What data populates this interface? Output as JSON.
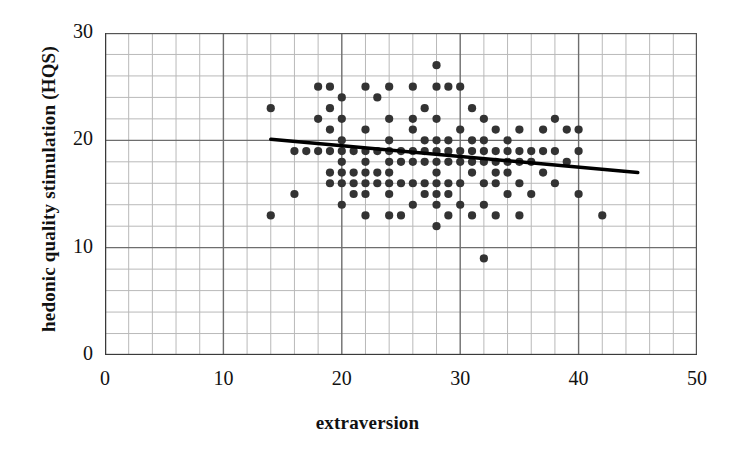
{
  "chart_data": {
    "type": "scatter",
    "title": "",
    "xlabel": "extraversion",
    "ylabel": "hedonic quality stimulation (HQS)",
    "xlim": [
      0,
      50
    ],
    "ylim": [
      0,
      30
    ],
    "xticks": [
      "0",
      "10",
      "20",
      "30",
      "40",
      "50"
    ],
    "xtick_values": [
      0,
      10,
      20,
      30,
      40,
      50
    ],
    "yticks": [
      "0",
      "10",
      "20",
      "30"
    ],
    "ytick_values": [
      0,
      10,
      20,
      30
    ],
    "grid": "major and minor gridlines, minor every 2 units on both axes",
    "legend": "none",
    "marker_color": "#333333",
    "line_color": "#000000",
    "trendline": {
      "label": "linear regression fit",
      "x": [
        14,
        45
      ],
      "y": [
        20.1,
        17.0
      ]
    },
    "points": [
      [
        14,
        23
      ],
      [
        14,
        13
      ],
      [
        16,
        19
      ],
      [
        16,
        15
      ],
      [
        17,
        19
      ],
      [
        18,
        19
      ],
      [
        18,
        25
      ],
      [
        18,
        22
      ],
      [
        19,
        19
      ],
      [
        19,
        23
      ],
      [
        19,
        25
      ],
      [
        19,
        21
      ],
      [
        19,
        17
      ],
      [
        19,
        16
      ],
      [
        20,
        19
      ],
      [
        20,
        24
      ],
      [
        20,
        22
      ],
      [
        20,
        20
      ],
      [
        20,
        18
      ],
      [
        20,
        17
      ],
      [
        20,
        16
      ],
      [
        20,
        14
      ],
      [
        21,
        19
      ],
      [
        21,
        17
      ],
      [
        21,
        16
      ],
      [
        21,
        15
      ],
      [
        22,
        19
      ],
      [
        22,
        25
      ],
      [
        22,
        21
      ],
      [
        22,
        18
      ],
      [
        22,
        17
      ],
      [
        22,
        16
      ],
      [
        22,
        15
      ],
      [
        22,
        13
      ],
      [
        23,
        19
      ],
      [
        23,
        24
      ],
      [
        23,
        17
      ],
      [
        23,
        16
      ],
      [
        24,
        25
      ],
      [
        24,
        22
      ],
      [
        24,
        20
      ],
      [
        24,
        19
      ],
      [
        24,
        18
      ],
      [
        24,
        17
      ],
      [
        24,
        16
      ],
      [
        24,
        15
      ],
      [
        24,
        13
      ],
      [
        25,
        19
      ],
      [
        25,
        18
      ],
      [
        25,
        16
      ],
      [
        25,
        13
      ],
      [
        26,
        25
      ],
      [
        26,
        22
      ],
      [
        26,
        21
      ],
      [
        26,
        19
      ],
      [
        26,
        18
      ],
      [
        26,
        16
      ],
      [
        26,
        14
      ],
      [
        27,
        23
      ],
      [
        27,
        20
      ],
      [
        27,
        19
      ],
      [
        27,
        18
      ],
      [
        27,
        16
      ],
      [
        27,
        15
      ],
      [
        28,
        27
      ],
      [
        28,
        25
      ],
      [
        28,
        22
      ],
      [
        28,
        20
      ],
      [
        28,
        19
      ],
      [
        28,
        18
      ],
      [
        28,
        17
      ],
      [
        28,
        16
      ],
      [
        28,
        15
      ],
      [
        28,
        14
      ],
      [
        28,
        12
      ],
      [
        29,
        25
      ],
      [
        29,
        20
      ],
      [
        29,
        19
      ],
      [
        29,
        18
      ],
      [
        29,
        16
      ],
      [
        29,
        15
      ],
      [
        29,
        13
      ],
      [
        30,
        25
      ],
      [
        30,
        21
      ],
      [
        30,
        19
      ],
      [
        30,
        18
      ],
      [
        30,
        16
      ],
      [
        30,
        14
      ],
      [
        31,
        23
      ],
      [
        31,
        20
      ],
      [
        31,
        19
      ],
      [
        31,
        18
      ],
      [
        31,
        17
      ],
      [
        31,
        13
      ],
      [
        32,
        22
      ],
      [
        32,
        20
      ],
      [
        32,
        19
      ],
      [
        32,
        18
      ],
      [
        32,
        16
      ],
      [
        32,
        14
      ],
      [
        32,
        9
      ],
      [
        33,
        21
      ],
      [
        33,
        19
      ],
      [
        33,
        18
      ],
      [
        33,
        17
      ],
      [
        33,
        16
      ],
      [
        33,
        13
      ],
      [
        34,
        20
      ],
      [
        34,
        19
      ],
      [
        34,
        18
      ],
      [
        34,
        17
      ],
      [
        34,
        15
      ],
      [
        35,
        21
      ],
      [
        35,
        19
      ],
      [
        35,
        18
      ],
      [
        35,
        16
      ],
      [
        35,
        13
      ],
      [
        36,
        19
      ],
      [
        36,
        18
      ],
      [
        36,
        15
      ],
      [
        37,
        21
      ],
      [
        37,
        19
      ],
      [
        37,
        17
      ],
      [
        38,
        22
      ],
      [
        38,
        19
      ],
      [
        38,
        16
      ],
      [
        39,
        21
      ],
      [
        39,
        18
      ],
      [
        40,
        21
      ],
      [
        40,
        19
      ],
      [
        40,
        15
      ],
      [
        42,
        13
      ]
    ]
  }
}
